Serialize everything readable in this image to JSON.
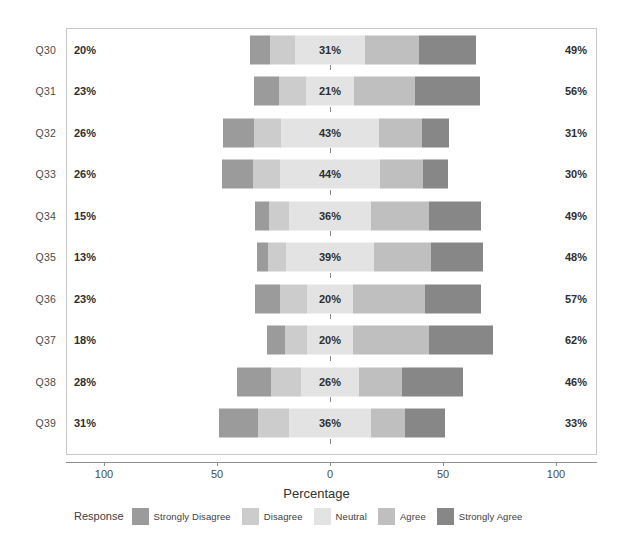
{
  "chart_data": {
    "type": "bar",
    "subtype": "diverging-stacked-likert",
    "title": "",
    "xlabel": "Percentage",
    "ylabel": "",
    "xlim": [
      -100,
      100
    ],
    "xticks": [
      -100,
      -50,
      0,
      50,
      100
    ],
    "xtick_labels": [
      "100",
      "50",
      "0",
      "50",
      "100"
    ],
    "grid": false,
    "legend_position": "bottom",
    "legend_title": "Response",
    "categories": [
      "Q30",
      "Q31",
      "Q32",
      "Q33",
      "Q34",
      "Q35",
      "Q36",
      "Q37",
      "Q38",
      "Q39"
    ],
    "series": [
      {
        "name": "Strongly Disagree",
        "color": "#9b9b9b",
        "values": [
          9,
          11,
          14,
          14,
          6,
          5,
          11,
          8,
          15,
          17
        ]
      },
      {
        "name": "Disagree",
        "color": "#cccccc",
        "values": [
          11,
          12,
          12,
          12,
          9,
          8,
          12,
          10,
          13,
          14
        ]
      },
      {
        "name": "Neutral",
        "color": "#e3e3e3",
        "values": [
          31,
          21,
          43,
          44,
          36,
          39,
          20,
          20,
          26,
          36
        ]
      },
      {
        "name": "Agree",
        "color": "#bfbfbf",
        "values": [
          24,
          27,
          19,
          19,
          26,
          25,
          32,
          34,
          19,
          15
        ]
      },
      {
        "name": "Strongly Agree",
        "color": "#878787",
        "values": [
          25,
          29,
          12,
          11,
          23,
          23,
          25,
          28,
          27,
          18
        ]
      }
    ],
    "left_totals": [
      20,
      23,
      26,
      26,
      15,
      13,
      23,
      18,
      28,
      31
    ],
    "center_values": [
      31,
      21,
      43,
      44,
      36,
      39,
      20,
      20,
      26,
      36
    ],
    "right_totals": [
      49,
      56,
      31,
      30,
      49,
      48,
      57,
      62,
      46,
      33
    ],
    "left_total_labels": [
      "20%",
      "23%",
      "26%",
      "26%",
      "15%",
      "13%",
      "23%",
      "18%",
      "28%",
      "31%"
    ],
    "center_labels": [
      "31%",
      "21%",
      "43%",
      "44%",
      "36%",
      "39%",
      "20%",
      "20%",
      "26%",
      "36%"
    ],
    "right_total_labels": [
      "49%",
      "56%",
      "31%",
      "30%",
      "49%",
      "48%",
      "57%",
      "62%",
      "46%",
      "33%"
    ]
  },
  "axis": {
    "title": "Percentage",
    "ticks": [
      {
        "label": "100",
        "value": -100
      },
      {
        "label": "50",
        "value": -50
      },
      {
        "label": "0",
        "value": 0
      },
      {
        "label": "50",
        "value": 50
      },
      {
        "label": "100",
        "value": 100
      }
    ]
  },
  "legend": {
    "title": "Response",
    "items": [
      {
        "label": "Strongly Disagree",
        "color": "#9b9b9b"
      },
      {
        "label": "Disagree",
        "color": "#cccccc"
      },
      {
        "label": "Neutral",
        "color": "#e3e3e3"
      },
      {
        "label": "Agree",
        "color": "#bfbfbf"
      },
      {
        "label": "Strongly Agree",
        "color": "#878787"
      }
    ]
  },
  "colors": {
    "panel_border": "#c8c8c8",
    "axis": "#8f8f8f",
    "text": "#3c3c3c",
    "background": "#ffffff"
  }
}
